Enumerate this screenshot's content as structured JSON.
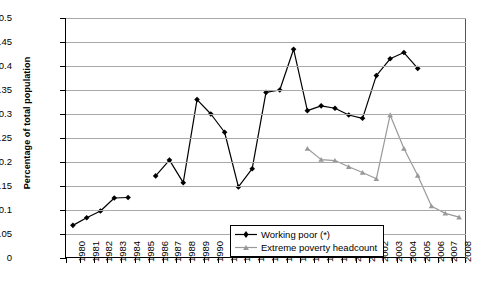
{
  "chart_data": {
    "type": "line",
    "title": "",
    "xlabel": "",
    "ylabel": "Percentage of total population",
    "ylim": [
      0,
      0.5
    ],
    "ytick_labels": [
      "0.5",
      "0.45",
      "0.4",
      "0.35",
      "0.3",
      "0.25",
      "0.2",
      "0.15",
      "0.1",
      "0.05",
      "0"
    ],
    "ytick_values": [
      0.5,
      0.45,
      0.4,
      0.35,
      0.3,
      0.25,
      0.2,
      0.15,
      0.1,
      0.05,
      0
    ],
    "grid": true,
    "legend_position": "bottom-right",
    "categories": [
      "1980",
      "1981",
      "1982",
      "1983",
      "1984",
      "1985",
      "1986",
      "1987",
      "1988",
      "1989",
      "1990",
      "1991",
      "1992",
      "1993",
      "1994",
      "1995",
      "1996",
      "1997",
      "1998",
      "1999",
      "2000",
      "2001",
      "2002",
      "2003",
      "2004",
      "2005",
      "2006",
      "2007",
      "2008"
    ],
    "series": [
      {
        "name": "Working poor (*)",
        "color": "#000000",
        "marker": "diamond",
        "values": [
          0.068,
          0.084,
          0.098,
          0.125,
          0.126,
          null,
          0.171,
          0.204,
          0.157,
          0.33,
          0.3,
          0.262,
          0.148,
          0.186,
          0.345,
          0.35,
          0.435,
          0.307,
          0.317,
          0.312,
          0.298,
          0.291,
          0.38,
          0.415,
          0.428,
          0.395,
          null,
          null,
          null
        ]
      },
      {
        "name": "Extreme poverty headcount",
        "color": "#999999",
        "marker": "triangle",
        "values": [
          null,
          null,
          null,
          null,
          null,
          null,
          null,
          null,
          null,
          null,
          null,
          null,
          null,
          null,
          null,
          null,
          null,
          0.228,
          0.205,
          0.203,
          0.19,
          0.178,
          0.165,
          0.298,
          0.228,
          0.172,
          0.108,
          0.093,
          0.085
        ]
      }
    ]
  },
  "legend": {
    "items": [
      {
        "label": "Working poor (*)"
      },
      {
        "label": "Extreme poverty headcount"
      }
    ]
  }
}
